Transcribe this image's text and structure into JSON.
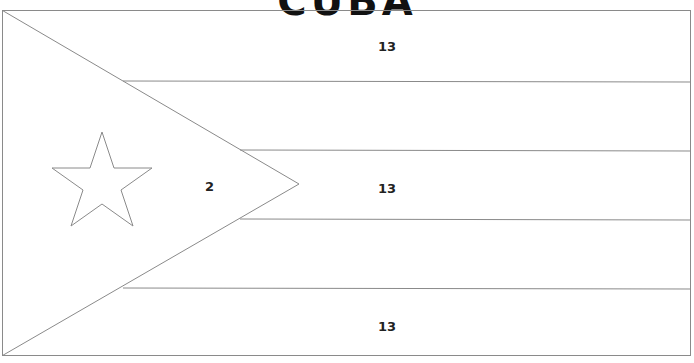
{
  "title": "CUBA",
  "stripe_labels": [
    "13",
    "13",
    "13"
  ],
  "triangle_label": "2",
  "colors": {
    "outline": "#8a8a8a",
    "background": "#ffffff"
  }
}
